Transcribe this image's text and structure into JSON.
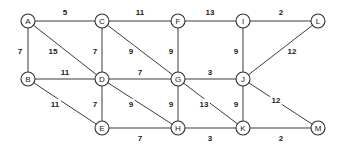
{
  "chart_data": {
    "type": "diagram",
    "diagram_kind": "weighted-undirected-graph",
    "title": "",
    "xlabel": "",
    "ylabel": "",
    "colors": {
      "background": "#ffffff",
      "edge": "#3b3b3b",
      "node_stroke": "#2e2e2e",
      "node_fill": "#ffffff",
      "text": "#1a1a1a"
    },
    "node_radius": 7,
    "nodes": [
      {
        "id": "A",
        "label": "A",
        "x": 28,
        "y": 21
      },
      {
        "id": "C",
        "label": "C",
        "x": 102,
        "y": 21
      },
      {
        "id": "F",
        "label": "F",
        "x": 178,
        "y": 21
      },
      {
        "id": "I",
        "label": "I",
        "x": 243,
        "y": 21
      },
      {
        "id": "L",
        "label": "L",
        "x": 318,
        "y": 21
      },
      {
        "id": "B",
        "label": "B",
        "x": 28,
        "y": 79
      },
      {
        "id": "D",
        "label": "D",
        "x": 102,
        "y": 79
      },
      {
        "id": "G",
        "label": "G",
        "x": 178,
        "y": 79
      },
      {
        "id": "J",
        "label": "J",
        "x": 243,
        "y": 79
      },
      {
        "id": "E",
        "label": "E",
        "x": 102,
        "y": 128
      },
      {
        "id": "H",
        "label": "H",
        "x": 178,
        "y": 128
      },
      {
        "id": "K",
        "label": "K",
        "x": 243,
        "y": 128
      },
      {
        "id": "M",
        "label": "M",
        "x": 318,
        "y": 128
      }
    ],
    "edges": [
      {
        "source": "A",
        "target": "C",
        "weight": 5,
        "label": "5",
        "lx": 65,
        "ly": 12
      },
      {
        "source": "C",
        "target": "F",
        "weight": 11,
        "label": "11",
        "lx": 140,
        "ly": 12
      },
      {
        "source": "F",
        "target": "I",
        "weight": 13,
        "label": "13",
        "lx": 210,
        "ly": 12
      },
      {
        "source": "I",
        "target": "L",
        "weight": 2,
        "label": "2",
        "lx": 281,
        "ly": 12
      },
      {
        "source": "A",
        "target": "B",
        "weight": 7,
        "label": "7",
        "lx": 20,
        "ly": 51
      },
      {
        "source": "A",
        "target": "D",
        "weight": 15,
        "label": "15",
        "lx": 53,
        "ly": 51
      },
      {
        "source": "C",
        "target": "D",
        "weight": 7,
        "label": "7",
        "lx": 95,
        "ly": 51
      },
      {
        "source": "C",
        "target": "G",
        "weight": 9,
        "label": "9",
        "lx": 131,
        "ly": 51
      },
      {
        "source": "F",
        "target": "G",
        "weight": 9,
        "label": "9",
        "lx": 171,
        "ly": 51
      },
      {
        "source": "I",
        "target": "J",
        "weight": 9,
        "label": "9",
        "lx": 236,
        "ly": 51
      },
      {
        "source": "J",
        "target": "L",
        "weight": 12,
        "label": "12",
        "lx": 292,
        "ly": 51
      },
      {
        "source": "B",
        "target": "D",
        "weight": 11,
        "label": "11",
        "lx": 65,
        "ly": 72
      },
      {
        "source": "D",
        "target": "G",
        "weight": 7,
        "label": "7",
        "lx": 140,
        "ly": 72
      },
      {
        "source": "G",
        "target": "J",
        "weight": 3,
        "label": "3",
        "lx": 210,
        "ly": 72
      },
      {
        "source": "B",
        "target": "E",
        "weight": 11,
        "label": "11",
        "lx": 55,
        "ly": 104
      },
      {
        "source": "D",
        "target": "E",
        "weight": 7,
        "label": "7",
        "lx": 95,
        "ly": 104
      },
      {
        "source": "D",
        "target": "H",
        "weight": 9,
        "label": "9",
        "lx": 131,
        "ly": 104
      },
      {
        "source": "G",
        "target": "H",
        "weight": 9,
        "label": "9",
        "lx": 171,
        "ly": 104
      },
      {
        "source": "G",
        "target": "K",
        "weight": 13,
        "label": "13",
        "lx": 204,
        "ly": 104
      },
      {
        "source": "J",
        "target": "K",
        "weight": 9,
        "label": "9",
        "lx": 236,
        "ly": 104
      },
      {
        "source": "J",
        "target": "M",
        "weight": 12,
        "label": "12",
        "lx": 276,
        "ly": 100
      },
      {
        "source": "E",
        "target": "H",
        "weight": 7,
        "label": "7",
        "lx": 140,
        "ly": 138
      },
      {
        "source": "H",
        "target": "K",
        "weight": 3,
        "label": "3",
        "lx": 210,
        "ly": 138
      },
      {
        "source": "K",
        "target": "M",
        "weight": 2,
        "label": "2",
        "lx": 281,
        "ly": 138
      }
    ]
  }
}
